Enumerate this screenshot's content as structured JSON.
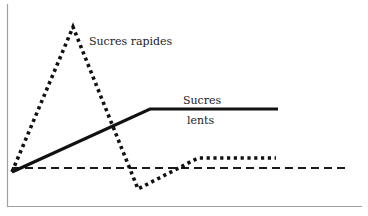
{
  "diagram": {
    "type": "line-sketch",
    "axes": {
      "x_axis_visible": true,
      "y_axis_visible": true,
      "ticks": false
    },
    "labels": {
      "fast_sugars": "Sucres rapides",
      "slow_sugars_line1": "Sucres",
      "slow_sugars_line2": "lents"
    },
    "series": [
      {
        "name": "Sucres rapides",
        "style": "dotted",
        "points": [
          [
            12,
            172
          ],
          [
            73,
            27
          ],
          [
            138,
            189
          ],
          [
            198,
            158
          ],
          [
            276,
            158
          ]
        ]
      },
      {
        "name": "Sucres lents",
        "style": "solid",
        "points": [
          [
            12,
            172
          ],
          [
            150,
            109
          ],
          [
            278,
            109
          ]
        ]
      },
      {
        "name": "baseline",
        "style": "dashed",
        "points": [
          [
            12,
            168
          ],
          [
            350,
            168
          ]
        ]
      }
    ],
    "colors": {
      "line": "#1a1a1a",
      "axis": "#9a9a9a",
      "background": "#ffffff"
    }
  }
}
